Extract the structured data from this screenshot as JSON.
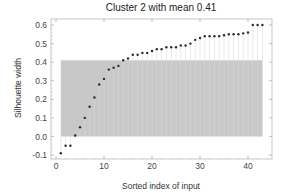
{
  "chart_data": {
    "type": "scatter",
    "title": "Cluster 2 with mean 0.41",
    "xlabel": "Sorted index of input",
    "ylabel": "Silhouette width",
    "xlim": [
      0,
      44
    ],
    "ylim": [
      -0.11,
      0.62
    ],
    "xticks": [
      0,
      10,
      20,
      30,
      40
    ],
    "xtick_labels": [
      "0",
      "10",
      "20",
      "30",
      "40"
    ],
    "yticks": [
      -0.1,
      0.0,
      0.1,
      0.2,
      0.3,
      0.4,
      0.5,
      0.6
    ],
    "ytick_labels": [
      "-0.1",
      "0.0",
      "0.1",
      "0.2",
      "0.3",
      "0.4",
      "0.5",
      "0.6"
    ],
    "mean": 0.41,
    "mean_band": {
      "x_start": 1,
      "x_end": 43,
      "y_start": 0.0,
      "y_end": 0.41
    },
    "x": [
      1,
      2,
      3,
      4,
      5,
      6,
      7,
      8,
      9,
      10,
      11,
      12,
      13,
      14,
      15,
      16,
      17,
      18,
      19,
      20,
      21,
      22,
      23,
      24,
      25,
      26,
      27,
      28,
      29,
      30,
      31,
      32,
      33,
      34,
      35,
      36,
      37,
      38,
      39,
      40,
      41,
      42,
      43
    ],
    "values": [
      -0.09,
      -0.05,
      -0.05,
      0.005,
      0.05,
      0.1,
      0.16,
      0.21,
      0.28,
      0.31,
      0.36,
      0.37,
      0.38,
      0.41,
      0.42,
      0.44,
      0.44,
      0.45,
      0.45,
      0.46,
      0.47,
      0.47,
      0.48,
      0.48,
      0.48,
      0.49,
      0.49,
      0.5,
      0.52,
      0.53,
      0.54,
      0.54,
      0.54,
      0.54,
      0.545,
      0.55,
      0.55,
      0.55,
      0.555,
      0.56,
      0.6,
      0.6,
      0.6
    ],
    "grid": false,
    "colors": {
      "band": "#c8c8c8",
      "point": "#2b2b2b",
      "stem": "#d9d9d9",
      "frame": "#b0b0b0"
    }
  }
}
